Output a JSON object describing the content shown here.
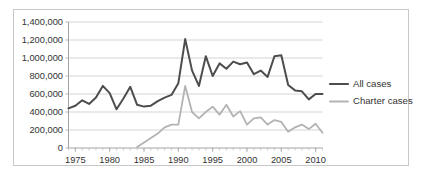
{
  "figure": {
    "border_color": "#c8c8c8",
    "background": "#ffffff"
  },
  "chart_data": {
    "type": "line",
    "title": "",
    "subtitle": "",
    "xlabel": "",
    "ylabel": "",
    "xlim": [
      1974,
      2011
    ],
    "ylim": [
      0,
      1400000
    ],
    "ytick_values": [
      0,
      200000,
      400000,
      600000,
      800000,
      1000000,
      1200000,
      1400000
    ],
    "ytick_labels": [
      "0",
      "200,000",
      "400,000",
      "600,000",
      "800,000",
      "1,000,000",
      "1,200,000",
      "1,400,000"
    ],
    "xtick_values": [
      1975,
      1980,
      1985,
      1990,
      1995,
      2000,
      2005,
      2010
    ],
    "xtick_labels": [
      "1975",
      "1980",
      "1985",
      "1990",
      "1995",
      "2000",
      "2005",
      "2010"
    ],
    "x_minor_tick_interval": 1,
    "grid": "horizontal",
    "legend_position": "right",
    "x": [
      1974,
      1975,
      1976,
      1977,
      1978,
      1979,
      1980,
      1981,
      1982,
      1983,
      1984,
      1985,
      1986,
      1987,
      1988,
      1989,
      1990,
      1991,
      1992,
      1993,
      1994,
      1995,
      1996,
      1997,
      1998,
      1999,
      2000,
      2001,
      2002,
      2003,
      2004,
      2005,
      2006,
      2007,
      2008,
      2009,
      2010,
      2011
    ],
    "series": [
      {
        "name": "All cases",
        "color": "#4d4d4d",
        "width": 2.0,
        "values": [
          440000,
          470000,
          530000,
          490000,
          560000,
          690000,
          610000,
          430000,
          550000,
          680000,
          480000,
          460000,
          470000,
          520000,
          560000,
          590000,
          720000,
          1210000,
          860000,
          690000,
          1020000,
          800000,
          940000,
          880000,
          960000,
          930000,
          950000,
          820000,
          860000,
          790000,
          1020000,
          1030000,
          700000,
          640000,
          630000,
          540000,
          600000,
          600000
        ]
      },
      {
        "name": "Charter cases",
        "color": "#b3b3b3",
        "width": 1.8,
        "values": [
          null,
          null,
          null,
          null,
          null,
          null,
          null,
          null,
          null,
          null,
          10000,
          60000,
          110000,
          160000,
          230000,
          260000,
          260000,
          690000,
          400000,
          330000,
          400000,
          460000,
          370000,
          480000,
          350000,
          410000,
          260000,
          330000,
          340000,
          260000,
          310000,
          290000,
          180000,
          230000,
          260000,
          210000,
          270000,
          170000
        ]
      }
    ]
  },
  "legend": {
    "items": [
      {
        "label": "All cases",
        "color": "#4d4d4d"
      },
      {
        "label": "Charter cases",
        "color": "#b3b3b3"
      }
    ]
  }
}
